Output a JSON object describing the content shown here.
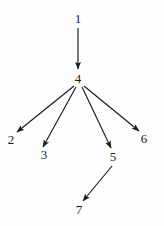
{
  "diagram": {
    "title": "",
    "type": "directed-graph",
    "background_color": "#fdfdfd",
    "stroke_color": "#1b1b1b",
    "label_color": "#1b1b1b",
    "width": 164,
    "height": 226,
    "nodes": [
      {
        "id": "1",
        "label": "1",
        "x": 78,
        "y": 18
      },
      {
        "id": "4",
        "label": "4",
        "x": 78,
        "y": 78
      },
      {
        "id": "2",
        "label": "2",
        "x": 11,
        "y": 139
      },
      {
        "id": "3",
        "label": "3",
        "x": 44,
        "y": 154
      },
      {
        "id": "5",
        "label": "5",
        "x": 113,
        "y": 156
      },
      {
        "id": "6",
        "label": "6",
        "x": 144,
        "y": 138
      },
      {
        "id": "7",
        "label": "7",
        "x": 79,
        "y": 209
      }
    ],
    "edges": [
      {
        "id": "edge-1-4",
        "from": "1",
        "to": "4",
        "x1": 78,
        "y1": 28,
        "x2": 78,
        "y2": 69
      },
      {
        "id": "edge-4-2",
        "from": "4",
        "to": "2",
        "x1": 74,
        "y1": 86,
        "x2": 17,
        "y2": 132
      },
      {
        "id": "edge-4-3",
        "from": "4",
        "to": "3",
        "x1": 76,
        "y1": 87,
        "x2": 43,
        "y2": 147
      },
      {
        "id": "edge-4-5",
        "from": "4",
        "to": "5",
        "x1": 82,
        "y1": 87,
        "x2": 111,
        "y2": 148
      },
      {
        "id": "edge-4-6",
        "from": "4",
        "to": "6",
        "x1": 84,
        "y1": 86,
        "x2": 139,
        "y2": 131
      },
      {
        "id": "edge-5-7",
        "from": "5",
        "to": "7",
        "x1": 112,
        "y1": 166,
        "x2": 83,
        "y2": 201
      }
    ]
  }
}
